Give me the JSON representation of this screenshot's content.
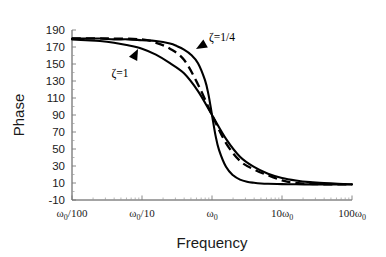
{
  "chart_data": {
    "type": "line",
    "title": "",
    "xlabel": "Frequency",
    "ylabel": "Phase",
    "xscale": "log",
    "xlim": [
      0.01,
      100
    ],
    "ylim": [
      -10,
      190
    ],
    "grid": false,
    "legend_position": "inline-annotations",
    "yticks": [
      190,
      170,
      150,
      130,
      110,
      90,
      70,
      50,
      30,
      10,
      -10
    ],
    "ytick_labels": [
      "190",
      "170",
      "150",
      "130",
      "110",
      "90",
      "70",
      "50",
      "30",
      "10",
      "-10"
    ],
    "xticks": [
      0.01,
      0.1,
      1,
      10,
      100
    ],
    "xtick_labels": [
      "ω₀/100",
      "ω₀/10",
      "ω₀",
      "10ω₀",
      "100ω₀"
    ],
    "xtick_parts": [
      {
        "pre": "",
        "sym": "ω",
        "sub": "0",
        "post": "/100"
      },
      {
        "pre": "",
        "sym": "ω",
        "sub": "0",
        "post": "/10"
      },
      {
        "pre": "",
        "sym": "ω",
        "sub": "0",
        "post": ""
      },
      {
        "pre": "10",
        "sym": "ω",
        "sub": "0",
        "post": ""
      },
      {
        "pre": "100",
        "sym": "ω",
        "sub": "0",
        "post": ""
      }
    ],
    "series": [
      {
        "name": "ζ=1/4",
        "style": "solid",
        "color": "#000000",
        "x": [
          0.01,
          0.0158,
          0.0251,
          0.0398,
          0.0631,
          0.1,
          0.158,
          0.251,
          0.316,
          0.398,
          0.501,
          0.631,
          0.794,
          0.891,
          1.0,
          1.122,
          1.259,
          1.585,
          2.0,
          2.512,
          3.162,
          3.98,
          5.01,
          6.31,
          10.0,
          15.8,
          25.1,
          39.8,
          63.1,
          100.0
        ],
        "y": [
          180,
          180,
          180,
          179,
          179,
          178,
          177,
          174,
          171,
          167,
          161,
          151,
          131,
          114,
          90,
          66,
          49,
          29,
          19,
          14,
          11.5,
          10.3,
          9.5,
          9.1,
          8.7,
          8.5,
          8.4,
          8.3,
          8.2,
          8.2
        ]
      },
      {
        "name": "ζ=1",
        "style": "solid",
        "color": "#000000",
        "x": [
          0.01,
          0.0158,
          0.0251,
          0.0398,
          0.0631,
          0.1,
          0.158,
          0.251,
          0.398,
          0.631,
          1.0,
          1.585,
          2.512,
          3.98,
          6.31,
          10.0,
          15.8,
          25.1,
          39.8,
          63.1,
          100.0
        ],
        "y": [
          179,
          178,
          177,
          175,
          172,
          168,
          161,
          151,
          139,
          118,
          90,
          62,
          41,
          29,
          21,
          16,
          13,
          11,
          9.8,
          9.0,
          8.5
        ]
      },
      {
        "name": "asymptote",
        "style": "dashed",
        "color": "#000000",
        "x": [
          0.01,
          0.0316,
          0.1,
          0.158,
          0.251,
          0.398,
          0.631,
          1.0,
          1.585,
          2.512,
          3.98,
          6.31,
          10.0,
          14.0,
          20.0,
          31.6,
          63.1,
          100.0
        ],
        "y": [
          180,
          180,
          179,
          175,
          168,
          155,
          126,
          90,
          57,
          36,
          26,
          19,
          13,
          10.5,
          9.3,
          8.6,
          8.4,
          8.4
        ]
      }
    ],
    "annotations": [
      {
        "text": "ζ=1/4",
        "sym": "ζ",
        "rest": "=1/4",
        "x_px": 222,
        "y_px": 41,
        "arrow": {
          "tip_x": 196,
          "tip_y": 49,
          "tail_x": 212,
          "tail_y": 40,
          "direction": "left-down"
        }
      },
      {
        "text": "ζ=1",
        "sym": "ζ",
        "rest": "=1",
        "x_px": 120,
        "y_px": 77,
        "arrow": {
          "tip_x": 138,
          "tip_y": 49,
          "tail_x": 131,
          "tail_y": 63,
          "direction": "up-right"
        }
      }
    ]
  },
  "plot_box": {
    "left": 72,
    "right": 352,
    "top": 30,
    "bottom": 200
  }
}
